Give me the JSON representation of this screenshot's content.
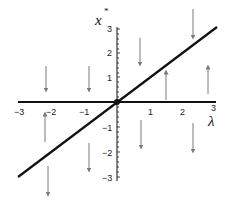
{
  "diagram": {
    "type": "phase-diagram",
    "x_axis": {
      "label": "λ",
      "range": [
        -3,
        3
      ],
      "ticks": [
        {
          "value": -3,
          "label": "−3"
        },
        {
          "value": -2,
          "label": "−2"
        },
        {
          "value": -1,
          "label": "−1"
        },
        {
          "value": 1,
          "label": "1"
        },
        {
          "value": 2,
          "label": "2"
        },
        {
          "value": 3,
          "label": "3"
        }
      ]
    },
    "y_axis": {
      "label": "x",
      "label_superscript": "*",
      "range": [
        -3,
        3
      ],
      "ticks": [
        {
          "value": 3,
          "label": "3"
        },
        {
          "value": 2,
          "label": "2"
        },
        {
          "value": 1,
          "label": "1"
        },
        {
          "value": -1,
          "label": "−1"
        },
        {
          "value": -2,
          "label": "−2"
        },
        {
          "value": -3,
          "label": "−3"
        }
      ]
    },
    "branches": [
      {
        "name": "x* = 0",
        "equation": "horizontal axis"
      },
      {
        "name": "x* = λ",
        "equation": "diagonal line"
      }
    ],
    "fixed_point": {
      "lambda": 0,
      "x": 0
    },
    "flow_arrows": [
      {
        "region": "upper-left-above",
        "direction": "down"
      },
      {
        "region": "upper-left-above",
        "direction": "down"
      },
      {
        "region": "upper-right-above",
        "direction": "down"
      },
      {
        "region": "upper-right-above",
        "direction": "down"
      },
      {
        "region": "upper-right-between",
        "direction": "up"
      },
      {
        "region": "upper-right-between",
        "direction": "up"
      },
      {
        "region": "lower-left-between",
        "direction": "up"
      },
      {
        "region": "lower-left-between",
        "direction": "down"
      },
      {
        "region": "lower-left-below",
        "direction": "down"
      },
      {
        "region": "lower-left-below",
        "direction": "down"
      },
      {
        "region": "lower-right-below",
        "direction": "down"
      },
      {
        "region": "lower-right-below",
        "direction": "down"
      }
    ],
    "colors": {
      "axis": "#111111",
      "branch_line": "#111111",
      "arrow": "#7a7a7a",
      "background": "#ffffff"
    }
  }
}
